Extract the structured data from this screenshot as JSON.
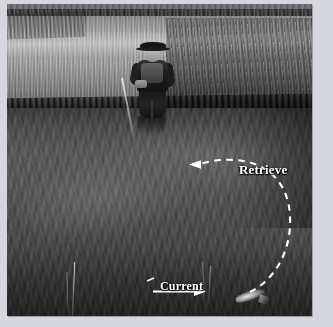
{
  "figure": {
    "kind": "photograph-with-annotations",
    "treatment": "black-and-white",
    "frame_color": "#d6d6de",
    "photo": {
      "left": 7,
      "top": 4,
      "width": 305,
      "height": 312
    }
  },
  "annotations": {
    "retrieve": {
      "label": "Retrieve",
      "color": "#ffffff",
      "arrow_style": "dashed-curve",
      "arrow_direction": "left",
      "label_left": 232,
      "label_top": 158,
      "font_size_px": 13
    },
    "current": {
      "label": "Current",
      "color": "#ffffff",
      "arrow_style": "solid-straight",
      "arrow_direction": "right",
      "label_left": 153,
      "label_top": 275,
      "font_size_px": 12
    }
  },
  "scene": {
    "bank_label": "grass bank",
    "water_label": "stream",
    "angler_label": "angler",
    "fish_label": "fish"
  },
  "colors": {
    "annotation_white": "#ffffff",
    "frame_gray": "#d6d6de",
    "water_dark": "#3a3a38",
    "water_mid": "#5a5a56",
    "grass_light": "#b6b6ad",
    "grass_dark": "#4a4a45"
  }
}
